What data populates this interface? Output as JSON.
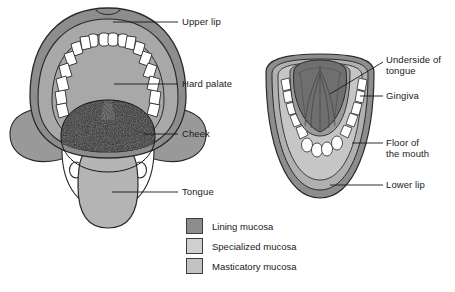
{
  "figure": {
    "left_view": {
      "name": "open-mouth-upper-view",
      "labels": [
        {
          "id": "upper-lip",
          "text": "Upper lip",
          "x": 182,
          "y": 18,
          "leader_from": [
            178,
            22
          ],
          "leader_to": [
            113,
            22
          ]
        },
        {
          "id": "hard-palate",
          "text": "Hard palate",
          "x": 182,
          "y": 80,
          "leader_from": [
            178,
            84
          ],
          "leader_to": [
            114,
            84
          ]
        },
        {
          "id": "cheek",
          "text": "Cheek",
          "x": 182,
          "y": 130,
          "leader_from": [
            178,
            134
          ],
          "leader_to": [
            143,
            134
          ]
        },
        {
          "id": "tongue",
          "text": "Tongue",
          "x": 182,
          "y": 188,
          "leader_from": [
            178,
            192
          ],
          "leader_to": [
            112,
            192
          ]
        }
      ]
    },
    "right_view": {
      "name": "lower-jaw-underside-view",
      "labels": [
        {
          "id": "underside-of-tongue",
          "text": "Underside of\ntongue",
          "x": 386,
          "y": 56,
          "leader_from": [
            383,
            62
          ],
          "leader_to": [
            330,
            94
          ]
        },
        {
          "id": "gingiva",
          "text": "Gingiva",
          "x": 386,
          "y": 92,
          "leader_from": [
            383,
            96
          ],
          "leader_to": [
            360,
            96
          ]
        },
        {
          "id": "floor-of-the-mouth",
          "text": "Floor of\nthe mouth",
          "x": 386,
          "y": 139,
          "leader_from": [
            383,
            143
          ],
          "leader_to": [
            352,
            143
          ]
        },
        {
          "id": "lower-lip",
          "text": "Lower lip",
          "x": 386,
          "y": 181,
          "leader_from": [
            383,
            185
          ],
          "leader_to": [
            330,
            185
          ]
        }
      ]
    }
  },
  "legend": {
    "name": "mucosa-legend",
    "items": [
      {
        "id": "lining-mucosa",
        "label": "Lining mucosa",
        "color": "#8d8d8d"
      },
      {
        "id": "specialized-mucosa",
        "label": "Specialized mucosa",
        "color": "#cfcfcf"
      },
      {
        "id": "masticatory-mucosa",
        "label": "Masticatory mucosa",
        "color": "#c2c2c2"
      }
    ]
  },
  "colors": {
    "lip_outer": "#8d8d8d",
    "lip_inner": "#a8a8a8",
    "palate": "#a8a8a8",
    "gingiva_band": "#9a9a9a",
    "teeth": "#ffffff",
    "oral_cavity": "#161616",
    "cheek": "#999999",
    "tongue_top": "#b4b4b4",
    "tongue_underside": "#6f6f6f",
    "floor_of_mouth": "#c6c6c6",
    "outline": "#2a2a2a",
    "label_text": "#1a1a1a",
    "background": "#ffffff"
  }
}
